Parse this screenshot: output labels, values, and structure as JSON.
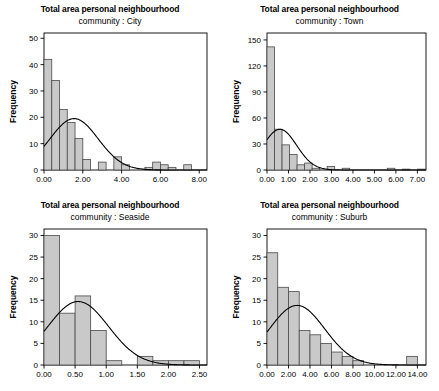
{
  "figure": {
    "panel_count": 4,
    "bar_fill": "#c9c9c9",
    "bar_stroke": "#4a4a4a",
    "curve_color": "#000000",
    "axis_color": "#000000",
    "background": "#ffffff"
  },
  "chart_data": [
    {
      "type": "bar",
      "title": "Total area personal neighbourhood",
      "subtitle": "community : City",
      "xlabel": "",
      "ylabel": "Frequency",
      "grid": false,
      "legend": null,
      "normal_curve": true,
      "xlim": [
        0.0,
        8.4
      ],
      "ylim": [
        0,
        52
      ],
      "xticks": [
        "0.00",
        "2.00",
        "4.00",
        "6.00",
        "8.00"
      ],
      "xtick_values": [
        0.0,
        2.0,
        4.0,
        6.0,
        8.0
      ],
      "yticks": [
        "0",
        "10",
        "20",
        "30",
        "40",
        "50"
      ],
      "ytick_values": [
        0,
        10,
        20,
        30,
        40,
        50
      ],
      "bin_width": 0.4,
      "bin_starts": [
        0.0,
        0.4,
        0.8,
        1.2,
        1.6,
        2.0,
        2.4,
        2.8,
        3.2,
        3.6,
        4.0,
        4.4,
        4.8,
        5.2,
        5.6,
        6.0,
        6.4,
        6.8,
        7.2
      ],
      "values": [
        42,
        34,
        23,
        18,
        12,
        4,
        0,
        3,
        0,
        5,
        2,
        0,
        0,
        1,
        3,
        2,
        1,
        0,
        2
      ],
      "curve_peak_x": 1.55,
      "curve_peak_y": 19.5
    },
    {
      "type": "bar",
      "title": "Total area personal neighbourhood",
      "subtitle": "community : Town",
      "xlabel": "",
      "ylabel": "Frequency",
      "grid": false,
      "legend": null,
      "normal_curve": true,
      "xlim": [
        0.0,
        7.4
      ],
      "ylim": [
        0,
        158
      ],
      "xticks": [
        "0.00",
        "1.00",
        "2.00",
        "3.00",
        "4.00",
        "5.00",
        "6.00",
        "7.00"
      ],
      "xtick_values": [
        0.0,
        1.0,
        2.0,
        3.0,
        4.0,
        5.0,
        6.0,
        7.0
      ],
      "yticks": [
        "0",
        "30",
        "60",
        "90",
        "120",
        "150"
      ],
      "ytick_values": [
        0,
        30,
        60,
        90,
        120,
        150
      ],
      "bin_width": 0.35,
      "bin_starts": [
        0.0,
        0.35,
        0.7,
        1.05,
        1.4,
        1.75,
        2.1,
        2.45,
        2.8,
        3.15,
        3.5,
        3.85,
        4.2,
        4.55,
        4.9,
        5.25,
        5.6,
        5.95,
        6.3,
        6.65,
        7.0
      ],
      "values": [
        142,
        47,
        29,
        18,
        6,
        8,
        2,
        0,
        4,
        0,
        2,
        0,
        0,
        0,
        0,
        0,
        2,
        0,
        1,
        0,
        1
      ],
      "curve_peak_x": 0.6,
      "curve_peak_y": 47
    },
    {
      "type": "bar",
      "title": "Total area personal neighbourhood",
      "subtitle": "community : Seaside",
      "xlabel": "",
      "ylabel": "Frequency",
      "grid": false,
      "legend": null,
      "normal_curve": true,
      "xlim": [
        0.0,
        2.62
      ],
      "ylim": [
        0,
        31.5
      ],
      "xticks": [
        "0.00",
        "0.50",
        "1.00",
        "1.50",
        "2.00",
        "2.50"
      ],
      "xtick_values": [
        0.0,
        0.5,
        1.0,
        1.5,
        2.0,
        2.5
      ],
      "yticks": [
        "0",
        "5",
        "10",
        "15",
        "20",
        "25",
        "30"
      ],
      "ytick_values": [
        0,
        5,
        10,
        15,
        20,
        25,
        30
      ],
      "bin_width": 0.25,
      "bin_starts": [
        0.0,
        0.25,
        0.5,
        0.75,
        1.0,
        1.25,
        1.5,
        1.75,
        2.0,
        2.25
      ],
      "values": [
        30,
        12,
        16,
        8,
        1,
        0,
        2,
        1,
        1,
        1
      ],
      "curve_peak_x": 0.55,
      "curve_peak_y": 14.7
    },
    {
      "type": "bar",
      "title": "Total area personal neighbourhood",
      "subtitle": "community : Suburb",
      "xlabel": "",
      "ylabel": "Frequency",
      "grid": false,
      "legend": null,
      "normal_curve": true,
      "xlim": [
        0.0,
        14.8
      ],
      "ylim": [
        0,
        31.5
      ],
      "xticks": [
        "0.00",
        "2.00",
        "4.00",
        "6.00",
        "8.00",
        "10.00",
        "12.00",
        "14.00"
      ],
      "xtick_values": [
        0.0,
        2.0,
        4.0,
        6.0,
        8.0,
        10.0,
        12.0,
        14.0
      ],
      "yticks": [
        "0",
        "5",
        "10",
        "15",
        "20",
        "25",
        "30"
      ],
      "ytick_values": [
        0,
        5,
        10,
        15,
        20,
        25,
        30
      ],
      "bin_width": 1.0,
      "bin_starts": [
        0.0,
        1.0,
        2.0,
        3.0,
        4.0,
        5.0,
        6.0,
        7.0,
        8.0,
        9.0,
        10.0,
        11.0,
        12.0,
        13.0
      ],
      "values": [
        26,
        18,
        17,
        8,
        7,
        5,
        3,
        2,
        1,
        0,
        0,
        0,
        0,
        2
      ],
      "curve_peak_x": 2.8,
      "curve_peak_y": 13.8
    }
  ]
}
